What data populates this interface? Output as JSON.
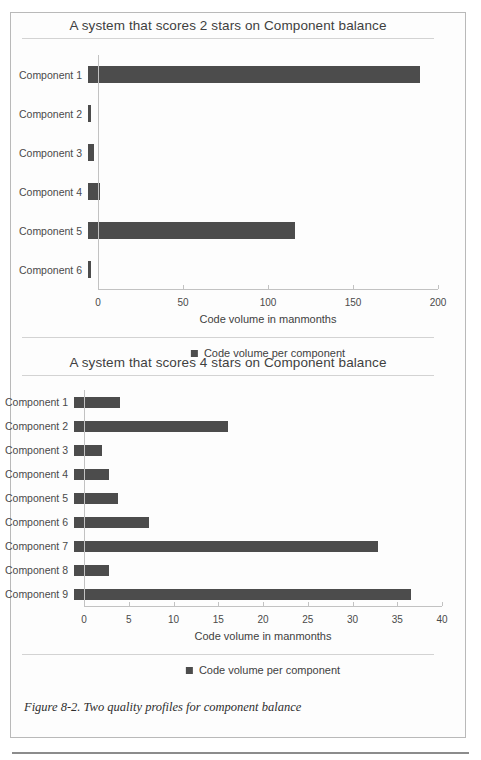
{
  "figure": {
    "caption": "Figure 8-2. Two quality profiles for component balance"
  },
  "charts": [
    {
      "id": "chart-2-stars",
      "title": "A system that scores 2 stars on Component balance",
      "legend_label": "Code volume per component",
      "chart_data": {
        "type": "bar",
        "orientation": "horizontal",
        "title": "A system that scores 2 stars on Component balance",
        "xlabel": "Code volume in manmonths",
        "ylabel": "",
        "categories": [
          "Component 1",
          "Component 2",
          "Component 3",
          "Component 4",
          "Component 5",
          "Component 6"
        ],
        "values": [
          195,
          1.5,
          3.5,
          7,
          122,
          2
        ],
        "series": [
          {
            "name": "Code volume per component",
            "values": [
              195,
              1.5,
              3.5,
              7,
              122,
              2
            ]
          }
        ],
        "xlim": [
          0,
          200
        ],
        "xticks": [
          0,
          50,
          100,
          150,
          200
        ],
        "xtick_labels": [
          "0",
          "50",
          "100",
          "150",
          "200"
        ],
        "grid": false,
        "legend_position": "bottom",
        "bar_color": "#4c4c4c"
      }
    },
    {
      "id": "chart-4-stars",
      "title": "A system that scores 4 stars on Component balance",
      "legend_label": "Code volume per component",
      "chart_data": {
        "type": "bar",
        "orientation": "horizontal",
        "title": "A system that scores 4 stars on Component balance",
        "xlabel": "Code volume in manmonths",
        "ylabel": "",
        "categories": [
          "Component 1",
          "Component 2",
          "Component 3",
          "Component 4",
          "Component 5",
          "Component 6",
          "Component 7",
          "Component 8",
          "Component 9"
        ],
        "values": [
          5.1,
          17.2,
          3.1,
          3.9,
          4.9,
          8.4,
          34,
          3.9,
          37.7
        ],
        "series": [
          {
            "name": "Code volume per component",
            "values": [
              5.1,
              17.2,
              3.1,
              3.9,
              4.9,
              8.4,
              34,
              3.9,
              37.7
            ]
          }
        ],
        "xlim": [
          0,
          40
        ],
        "xticks": [
          0,
          5,
          10,
          15,
          20,
          25,
          30,
          35,
          40
        ],
        "xtick_labels": [
          "0",
          "5",
          "10",
          "15",
          "20",
          "25",
          "30",
          "35",
          "40"
        ],
        "grid": false,
        "legend_position": "bottom",
        "bar_color": "#4c4c4c"
      }
    }
  ]
}
